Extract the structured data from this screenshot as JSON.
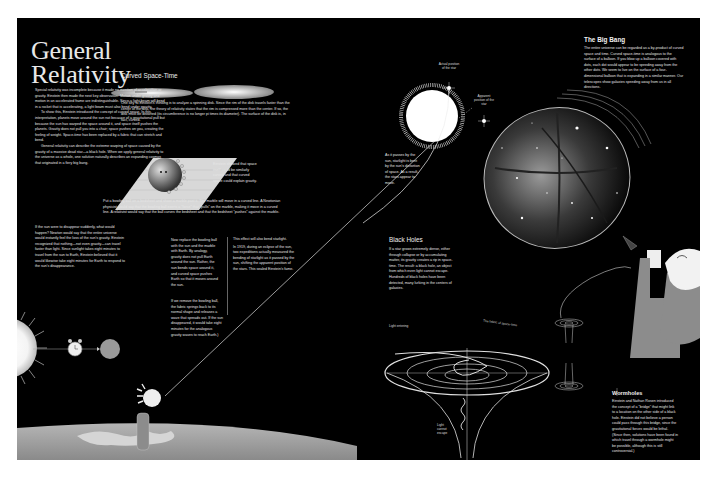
{
  "title": {
    "line1": "General",
    "line2": "Relativity"
  },
  "intro": {
    "p1": "Special relativity was incomplete because it made no mention of acceleration or gravity. Einstein then made the next key observation: Motion under gravity and motion in an accelerated frame are indistinguishable. Since a light beam will bend in a rocket that is accelerating, a light beam must also bend under gravity.",
    "p2": "To show this, Einstein introduced the concept of curved space. In this interpretation, planets move around the sun not because of a gravitational pull but because the sun has warped the space around it, and space itself pushes the planets. Gravity does not pull you into a chair; space pushes on you, creating the feeling of weight. Space-time has been replaced by a fabric that can stretch and bend.",
    "p3": "General relativity can describe the extreme warping of space caused by the gravity of a massive dead star—a black hole. When we apply general relativity to the universe as a whole, one solution naturally describes an expanding cosmos that originated in a fiery big bang."
  },
  "sun_disappear": {
    "text": "If the sun were to disappear suddenly, what would happen? Newton would say that the entire universe would instantly feel the loss of the sun's gravity. Einstein recognized that nothing—not even gravity—can travel faster than light. Since sunlight takes eight minutes to travel from the sun to Earth, Einstein believed that it would likewise take eight minutes for Earth to respond to the sun's disappearance."
  },
  "curved_space_time": {
    "heading": "Curved Space-Time",
    "disk_text": "One key to Einstein's thinking is to analyze a spinning disk. Since the rim of the disk travels faster than the center of the disk, the theory of relativity states that the rim is compressed more than the center. If so, the disk must be distorted (its circumference is no longer pi times its diameter). The surface of the disk is, in fact, curved.",
    "space_caption": "Einstein showed that space itself could be similarly curved and that curved space could explain gravity.",
    "bedsheet_text": "Put a bowling ball on a bedsheet and shoot a marble past it. The marble will move in a curved line. A Newtonian physicist would say that the bowling ball exerts a \"force\" that \"pulls\" on the marble, making it move in a curved line. A relativist would say that the ball curves the bedsheet and that the bedsheet \"pushes\" against the marble.",
    "replace_text": "Now replace the bowling ball with the sun and the marble with Earth. By analogy, gravity does not pull Earth around the sun. Rather, the sun bends space around it, and curved space pushes Earth so that it moves around the sun.",
    "remove_text": "If we remove the bowling ball, the fabric springs back to its normal shape and releases a wave that spreads out. If the sun disappeared, it would take eight minutes for the analogous gravity waves to reach Earth.)"
  },
  "starlight": {
    "lead": "This effect will also bend starlight.",
    "text": "In 1919, during an eclipse of the sun, two expeditions actually measured the bending of starlight as it passed by the sun, shifting the apparent position of the stars. This sealed Einstein's fame.",
    "sun_caption": "As it passes by the sun, starlight is bent by the sun's distortion of space. As a result, the stars appear to move.",
    "actual_label": "Actual position of the star",
    "apparent_label": "Apparent position of the star"
  },
  "big_bang": {
    "heading": "The Big Bang",
    "text": "The entire universe can be regarded as a by-product of curved space and time. Curved space-time is analogous to the surface of a balloon. If you blow up a balloon covered with dots, each dot would appear to be speeding away from the other dots. We seem to live on the surface of a four-dimensional balloon that is expanding in a similar manner. Our telescopes show galaxies speeding away from us in all directions."
  },
  "black_holes": {
    "heading": "Black Holes",
    "text": "If a star grows extremely dense, either through collapse or by accumulating matter, its gravity creates a rip in space-time. The result: a black hole, an object from which even light cannot escape. Hundreds of black holes have been detected, many lurking in the centers of galaxies.",
    "light_entering": "Light entering",
    "fabric_label": "The fabric of space-time",
    "light_cannot_escape": "Light cannot escape"
  },
  "wormholes": {
    "heading": "Wormholes",
    "text": "Einstein and Nathan Rosen introduced the concept of a \"bridge\" that might link to a location on the other side of a black hole. Einstein did not believe a person could pass through this bridge, since the gravitational forces would be lethal. (Since then, solutions have been found in which travel through a wormhole might be possible, although this is still controversial.)"
  },
  "colors": {
    "background": "#000000",
    "page": "#ffffff",
    "text": "#e6e6e6",
    "earth": "#9a9a9a",
    "sweater": "#8c8c8c"
  }
}
